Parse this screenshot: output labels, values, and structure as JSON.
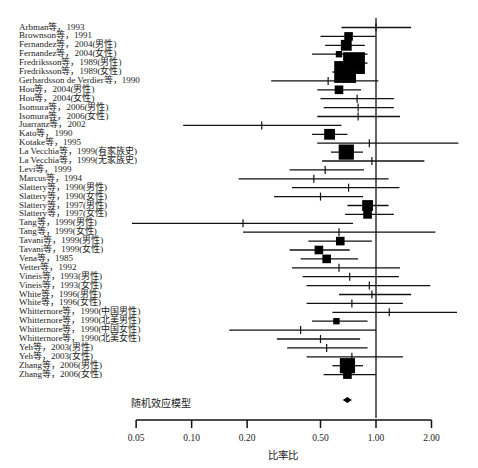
{
  "chart_data": {
    "type": "forest",
    "title": "",
    "xlabel": "比率比",
    "ylabel": "",
    "x_scale": "log",
    "xlim": [
      0.05,
      2.0
    ],
    "x_ticks": [
      0.05,
      0.1,
      0.2,
      0.5,
      1.0,
      2.0
    ],
    "x_tick_labels": [
      "0.05",
      "0.10",
      "0.20",
      "0.50",
      "1.00",
      "2.00"
    ],
    "reference_line": 1.0,
    "grid": false,
    "legend": null,
    "studies": [
      {
        "label": "Arbman等，1993",
        "or": 1.0,
        "lower": 0.65,
        "upper": 1.55,
        "weight": 1
      },
      {
        "label": "Brownson等，1991",
        "or": 0.71,
        "lower": 0.5,
        "upper": 1.0,
        "weight": 3
      },
      {
        "label": "Fernandez等，2004(男性)",
        "or": 0.69,
        "lower": 0.53,
        "upper": 0.87,
        "weight": 4
      },
      {
        "label": "Fernandez等，2004(女性)",
        "or": 0.63,
        "lower": 0.45,
        "upper": 0.9,
        "weight": 2
      },
      {
        "label": "Fredriksson等，1989(男性)",
        "or": 0.76,
        "lower": 0.64,
        "upper": 0.9,
        "weight": 9
      },
      {
        "label": "Fredriksson等，1989(女性)",
        "or": 0.68,
        "lower": 0.58,
        "upper": 0.8,
        "weight": 9
      },
      {
        "label": "Gerhardsson de Verdier等，1990",
        "or": 0.55,
        "lower": 0.27,
        "upper": 1.03,
        "weight": 1
      },
      {
        "label": "Hou等，2004(男性)",
        "or": 0.63,
        "lower": 0.48,
        "upper": 0.83,
        "weight": 3
      },
      {
        "label": "Hou等，2004(女性)",
        "or": 0.79,
        "lower": 0.5,
        "upper": 1.25,
        "weight": 1
      },
      {
        "label": "Isomura等，2006(男性)",
        "or": 0.8,
        "lower": 0.52,
        "upper": 1.25,
        "weight": 1
      },
      {
        "label": "Isomura等，2006(女性)",
        "or": 0.8,
        "lower": 0.48,
        "upper": 1.35,
        "weight": 1
      },
      {
        "label": "Juarranz等，2002",
        "or": 0.24,
        "lower": 0.09,
        "upper": 0.65,
        "weight": 1
      },
      {
        "label": "Kato等，1990",
        "or": 0.56,
        "lower": 0.45,
        "upper": 0.7,
        "weight": 4
      },
      {
        "label": "Kotake等，1995",
        "or": 0.92,
        "lower": 0.48,
        "upper": 2.8,
        "weight": 1
      },
      {
        "label": "La Vecchia等，1999(有家族史)",
        "or": 0.69,
        "lower": 0.57,
        "upper": 0.85,
        "weight": 6
      },
      {
        "label": "La Vecchia等，1999(无家族史)",
        "or": 0.95,
        "lower": 0.51,
        "upper": 1.83,
        "weight": 1
      },
      {
        "label": "Levi等，1999",
        "or": 0.53,
        "lower": 0.34,
        "upper": 0.86,
        "weight": 1
      },
      {
        "label": "Marcus等，1994",
        "or": 0.46,
        "lower": 0.18,
        "upper": 1.17,
        "weight": 1
      },
      {
        "label": "Slattery等，1990(男性)",
        "or": 0.71,
        "lower": 0.35,
        "upper": 1.34,
        "weight": 1
      },
      {
        "label": "Slattery等，1990(女性)",
        "or": 0.5,
        "lower": 0.28,
        "upper": 0.85,
        "weight": 1
      },
      {
        "label": "Slattery等，1997(男性)",
        "or": 0.9,
        "lower": 0.7,
        "upper": 1.17,
        "weight": 4
      },
      {
        "label": "Slattery等，1997(女性)",
        "or": 0.9,
        "lower": 0.68,
        "upper": 1.25,
        "weight": 3
      },
      {
        "label": "Tang等，1999(男性)",
        "or": 0.19,
        "lower": 0.045,
        "upper": 0.75,
        "weight": 1
      },
      {
        "label": "Tang等，1999(女性)",
        "or": 0.63,
        "lower": 0.19,
        "upper": 2.1,
        "weight": 1
      },
      {
        "label": "Tavani等，1999(男性)",
        "or": 0.64,
        "lower": 0.43,
        "upper": 0.95,
        "weight": 3
      },
      {
        "label": "Tavani等，1999(女性)",
        "or": 0.49,
        "lower": 0.34,
        "upper": 0.72,
        "weight": 3
      },
      {
        "label": "Vena等，1985",
        "or": 0.54,
        "lower": 0.39,
        "upper": 0.8,
        "weight": 3
      },
      {
        "label": "Vetter等，1992",
        "or": 0.63,
        "lower": 0.35,
        "upper": 1.35,
        "weight": 1
      },
      {
        "label": "Vineis等，1993(男性)",
        "or": 0.72,
        "lower": 0.4,
        "upper": 1.33,
        "weight": 1
      },
      {
        "label": "Vineis等，1993(女性)",
        "or": 0.92,
        "lower": 0.42,
        "upper": 1.97,
        "weight": 1
      },
      {
        "label": "White等，1996(男性)",
        "or": 0.95,
        "lower": 0.63,
        "upper": 1.55,
        "weight": 1
      },
      {
        "label": "White等，1996(女性)",
        "or": 0.74,
        "lower": 0.42,
        "upper": 1.4,
        "weight": 1
      },
      {
        "label": "Whitternore等，1990(中国男性)",
        "or": 1.18,
        "lower": 0.58,
        "upper": 2.75,
        "weight": 1
      },
      {
        "label": "Whitternore等，1990(北美男性)",
        "or": 0.61,
        "lower": 0.45,
        "upper": 0.9,
        "weight": 2
      },
      {
        "label": "Whitternore等，1990(中国女性)",
        "or": 0.39,
        "lower": 0.16,
        "upper": 1.0,
        "weight": 1
      },
      {
        "label": "Whitternore等，1990(北美女性)",
        "or": 0.5,
        "lower": 0.29,
        "upper": 0.82,
        "weight": 1
      },
      {
        "label": "Yeh等，2003(男性)",
        "or": 0.54,
        "lower": 0.33,
        "upper": 0.9,
        "weight": 1
      },
      {
        "label": "Yeh等，2003(女性)",
        "or": 0.74,
        "lower": 0.42,
        "upper": 1.4,
        "weight": 1
      },
      {
        "label": "Zhang等，2006(男性)",
        "or": 0.7,
        "lower": 0.58,
        "upper": 0.85,
        "weight": 6
      },
      {
        "label": "Zhang等，2006(女性)",
        "or": 0.7,
        "lower": 0.52,
        "upper": 1.0,
        "weight": 3
      }
    ],
    "pooled": {
      "label": "随机效应模型",
      "or": 0.7,
      "lower": 0.66,
      "upper": 0.74
    }
  }
}
